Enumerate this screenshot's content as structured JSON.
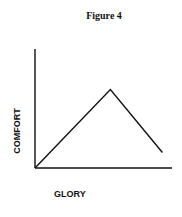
{
  "title": "Figure 4",
  "chart_data": {
    "type": "line",
    "title": "Figure 4",
    "xlabel": "GLORY",
    "ylabel": "COMFORT",
    "x": [
      0,
      0.55,
      0.93
    ],
    "series": [
      {
        "name": "comfort",
        "values": [
          0,
          0.66,
          0.13
        ]
      }
    ],
    "xlim": [
      0,
      1
    ],
    "ylim": [
      0,
      1
    ],
    "grid": false,
    "ticks": "none",
    "legend": "none"
  }
}
